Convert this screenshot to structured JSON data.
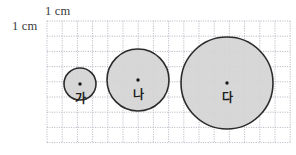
{
  "canvas": {
    "width": 296,
    "height": 155,
    "background_color": "#ffffff"
  },
  "annotations": {
    "horizontal_unit_label": "1 cm",
    "vertical_unit_label": "1 cm"
  },
  "grid": {
    "origin_x": 47,
    "origin_y": 21,
    "cell_size_px": 15.2,
    "columns": 16,
    "rows": 8,
    "line_color": "#b9b9c6",
    "line_style": "dotted",
    "unit_per_cell": "1 cm"
  },
  "figure": {
    "type": "circles-on-grid",
    "fill_color": "#d4d4d4",
    "stroke_color": "#2b2b2b",
    "center_dot_color": "#1a1a1a",
    "circles": [
      {
        "label": "가",
        "center_x": 80,
        "center_y": 84,
        "radius_px": 16,
        "diameter_cells": 2,
        "diameter_cm": 2,
        "radius_cm": 1,
        "show_center_dot": true
      },
      {
        "label": "나",
        "center_x": 138,
        "center_y": 80,
        "radius_px": 31,
        "diameter_cells": 4,
        "diameter_cm": 4,
        "radius_cm": 2,
        "show_center_dot": true
      },
      {
        "label": "다",
        "center_x": 227,
        "center_y": 83,
        "radius_px": 46,
        "diameter_cells": 6,
        "diameter_cm": 6,
        "radius_cm": 3,
        "show_center_dot": true
      }
    ]
  }
}
